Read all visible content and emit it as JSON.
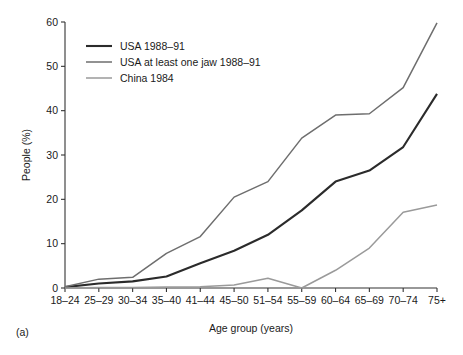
{
  "figure": {
    "panel_label": "(a)",
    "background": "#ffffff"
  },
  "chart_data": {
    "type": "line",
    "title": "",
    "xlabel": "Age group (years)",
    "ylabel": "People (%)",
    "categories": [
      "18–24",
      "25–29",
      "30–34",
      "35–40",
      "41–44",
      "45–50",
      "51–54",
      "55–59",
      "60–64",
      "65–69",
      "70–74",
      "75+"
    ],
    "ylim": [
      0,
      60
    ],
    "yticks": [
      0,
      10,
      20,
      30,
      40,
      50,
      60
    ],
    "ytick_labels": [
      "0",
      "10",
      "20",
      "30",
      "40",
      "50",
      "60"
    ],
    "grid": false,
    "legend_position": "upper-left-inside",
    "series": [
      {
        "name": "USA 1988–91",
        "color": "#2b2b2b",
        "width": 2.1,
        "values": [
          0.2,
          1.0,
          1.5,
          2.6,
          5.6,
          8.4,
          12.0,
          17.5,
          24.0,
          26.5,
          31.8,
          43.8
        ]
      },
      {
        "name": "USA at least one jaw 1988–91",
        "color": "#6e6e6e",
        "width": 1.5,
        "values": [
          0.3,
          2.0,
          2.4,
          7.8,
          11.6,
          20.5,
          24.0,
          33.8,
          39.0,
          39.3,
          45.2,
          59.8
        ]
      },
      {
        "name": "China 1984",
        "color": "#9a9a9a",
        "width": 1.5,
        "values": [
          0.0,
          0.1,
          0.1,
          0.2,
          0.3,
          0.7,
          2.2,
          0.0,
          4.0,
          9.0,
          17.1,
          18.7
        ]
      }
    ]
  },
  "legend": {
    "items": [
      {
        "label": "USA 1988–91"
      },
      {
        "label": "USA at least one jaw 1988–91"
      },
      {
        "label": "China 1984"
      }
    ]
  }
}
